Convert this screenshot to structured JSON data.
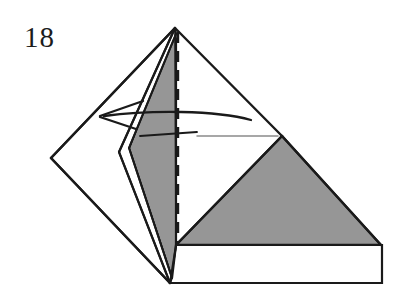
{
  "figure": {
    "step_number": "18",
    "type": "origami-fold-diagram",
    "title": "Origami step 18 — fold flap to the left",
    "background_color": "#ffffff",
    "colors": {
      "paper_front": "#ffffff",
      "paper_back_shaded": "#969696",
      "outline": "#1a1a1a",
      "fold_line_dashed": "#1a1a1a",
      "crease_line_light": "#8a8a8a",
      "arrow": "#1a1a1a",
      "label_text": "#1c1c1c"
    },
    "stroke_widths": {
      "outline": 2.4,
      "inner_edge": 1.8,
      "dashed": 2.2,
      "crease_light": 1.4,
      "arrow": 2.2
    },
    "geometry": {
      "apex": [
        175,
        28
      ],
      "left_diamond_vertex": [
        51,
        158
      ],
      "bottom_point": [
        170,
        283
      ],
      "flap_left_point": [
        119,
        152
      ],
      "inner_right_vertex": [
        282,
        136
      ],
      "gray_triangle_right": [
        381,
        245
      ],
      "base_rect_top_left": [
        176,
        245
      ],
      "base_rect_top_right": [
        382,
        245
      ],
      "base_rect_bottom_right": [
        382,
        283
      ],
      "base_rect_bottom_left": [
        170,
        283
      ],
      "dashed_line_x": 178,
      "dashed_line_y_start": 32,
      "dashed_line_y_end": 245
    },
    "shapes": {
      "left_white_panel": "51,158 175,28 175,245 170,283",
      "gray_left_flap": "175,28 119,152 170,283 176,245 175,28",
      "white_sliver_flap": "175,30 117,152 168,283",
      "gray_right_triangle": "282,136 381,245 176,245",
      "white_base_rect": "176,245 382,245 382,283 170,283",
      "upper_white_right": "175,28 282,136 176,245"
    },
    "annotations": {
      "arrow_label": "fold-left-arrow",
      "arrow_direction": "left",
      "arrow_tip": [
        100,
        116
      ],
      "arrow_tail": [
        251,
        120
      ],
      "crease_dark": {
        "x1": 140,
        "y1": 136,
        "x2": 196,
        "y2": 132
      },
      "crease_light": {
        "x1": 196,
        "y1": 136,
        "x2": 277,
        "y2": 136
      }
    }
  }
}
